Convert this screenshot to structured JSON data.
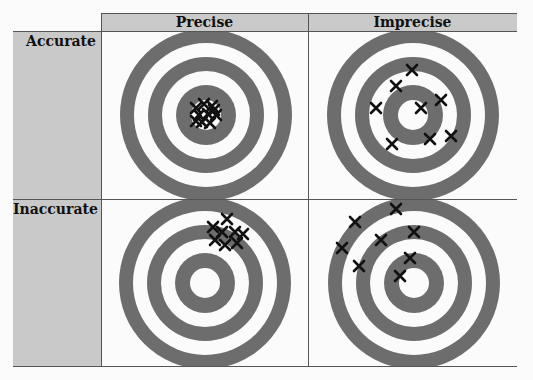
{
  "columns": [
    {
      "label": "Precise"
    },
    {
      "label": "Imprecise"
    }
  ],
  "rows": [
    {
      "label": "Accurate"
    },
    {
      "label": "Inaccurate"
    }
  ],
  "colors": {
    "ring_dark": "#6d6d6d",
    "ring_light": "#fbfbfb",
    "label_bg": "#c9c9c9",
    "mark": "#111111"
  },
  "target": {
    "ring_radii": [
      86,
      72,
      58,
      44,
      30,
      15
    ],
    "ring_fill": [
      "dark",
      "light",
      "dark",
      "light",
      "dark",
      "light"
    ]
  },
  "cells": [
    {
      "row": "Accurate",
      "col": "Precise",
      "center": [
        206,
        115
      ],
      "marks": [
        [
          196,
          108
        ],
        [
          204,
          104
        ],
        [
          212,
          106
        ],
        [
          199,
          115
        ],
        [
          208,
          114
        ],
        [
          216,
          115
        ],
        [
          202,
          122
        ],
        [
          210,
          123
        ],
        [
          196,
          121
        ],
        [
          214,
          110
        ]
      ]
    },
    {
      "row": "Accurate",
      "col": "Imprecise",
      "center": [
        413,
        115
      ],
      "marks": [
        [
          412,
          70
        ],
        [
          396,
          86
        ],
        [
          441,
          100
        ],
        [
          376,
          108
        ],
        [
          421,
          108
        ],
        [
          392,
          144
        ],
        [
          430,
          139
        ],
        [
          451,
          136
        ]
      ]
    },
    {
      "row": "Inaccurate",
      "col": "Precise",
      "center": [
        205,
        283
      ],
      "marks": [
        [
          213,
          227
        ],
        [
          227,
          219
        ],
        [
          222,
          232
        ],
        [
          235,
          232
        ],
        [
          243,
          234
        ],
        [
          215,
          240
        ],
        [
          225,
          245
        ],
        [
          237,
          243
        ]
      ]
    },
    {
      "row": "Inaccurate",
      "col": "Imprecise",
      "center": [
        414,
        283
      ],
      "marks": [
        [
          396,
          209
        ],
        [
          355,
          222
        ],
        [
          414,
          232
        ],
        [
          381,
          240
        ],
        [
          342,
          248
        ],
        [
          410,
          258
        ],
        [
          359,
          266
        ],
        [
          400,
          276
        ]
      ]
    }
  ]
}
